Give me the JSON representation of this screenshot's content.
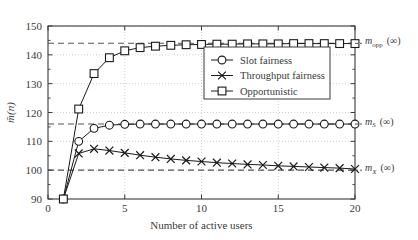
{
  "chart_data": {
    "type": "line",
    "title": "",
    "xlabel": "Number of active users",
    "ylabel": "m̄(n)",
    "xlim": [
      0,
      20
    ],
    "ylim": [
      90,
      150
    ],
    "xticks": [
      0,
      5,
      10,
      15,
      20
    ],
    "yticks": [
      90,
      100,
      110,
      120,
      130,
      140,
      150
    ],
    "xticklabels": [
      "0",
      "5",
      "10",
      "15",
      "20"
    ],
    "yticklabels": [
      "90",
      "100",
      "110",
      "120",
      "130",
      "140",
      "150"
    ],
    "yminorticks": [
      95,
      105,
      115,
      125,
      135,
      145
    ],
    "grid": true,
    "grid_style": "dotted",
    "legend_position": "upper-right-inside",
    "x": [
      1,
      2,
      3,
      4,
      5,
      6,
      7,
      8,
      9,
      10,
      11,
      12,
      13,
      14,
      15,
      16,
      17,
      18,
      19,
      20
    ],
    "series": [
      {
        "name": "Slot fairness",
        "marker": "circle",
        "values": [
          90,
          110.0,
          114.5,
          115.6,
          115.9,
          116.0,
          116.0,
          116.0,
          116.0,
          116.0,
          116.0,
          116.0,
          116.0,
          116.0,
          116.0,
          116.0,
          116.0,
          116.0,
          116.0,
          116.0
        ]
      },
      {
        "name": "Throughput fairness",
        "marker": "x",
        "values": [
          90,
          105.8,
          107.4,
          106.8,
          106.0,
          105.2,
          104.5,
          103.9,
          103.4,
          103.0,
          102.6,
          102.3,
          102.0,
          101.8,
          101.5,
          101.3,
          101.1,
          100.9,
          100.7,
          100.4
        ]
      },
      {
        "name": "Opportunistic",
        "marker": "square",
        "values": [
          90,
          121.2,
          133.5,
          139.0,
          141.4,
          142.5,
          143.0,
          143.3,
          143.5,
          143.6,
          143.7,
          143.7,
          143.8,
          143.8,
          143.8,
          143.9,
          143.9,
          143.9,
          143.9,
          143.9
        ]
      }
    ],
    "asymptotes": [
      {
        "value": 144.0,
        "label": "m_opp(∞)",
        "label_base": "m",
        "label_sub": "opp",
        "label_arg": "(∞)",
        "style": "dashed"
      },
      {
        "value": 116.0,
        "label": "m_S(∞)",
        "label_base": "m",
        "label_sub": "S",
        "label_arg": "(∞)",
        "style": "dashed"
      },
      {
        "value": 100.0,
        "label": "m_X(∞)",
        "label_base": "m",
        "label_sub": "X",
        "label_arg": "(∞)",
        "style": "dashed"
      }
    ],
    "colors": {
      "line": "#1a1a1a",
      "asymptote": "#555555",
      "grid": "#bdbdbd",
      "axis": "#3a3a3a",
      "text": "#3a3a3a",
      "background": "#ffffff"
    }
  }
}
